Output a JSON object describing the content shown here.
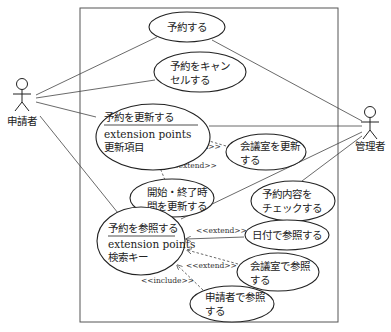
{
  "diagram": {
    "type": "UML use case diagram",
    "colors": {
      "line": "#333333",
      "background": "#ffffff",
      "text": "#222222"
    },
    "actors": [
      {
        "id": "applicant",
        "label": "申請者"
      },
      {
        "id": "admin",
        "label": "管理者"
      }
    ],
    "use_cases": {
      "reserve": {
        "line1": "予約する"
      },
      "cancel": {
        "line1": "予約をキャン",
        "line2": "セルする"
      },
      "update": {
        "title": "予約を更新する",
        "ext_label": "extension points",
        "ext_point": "更新項目"
      },
      "update_room": {
        "line1": "会議室を更新",
        "line2": "する"
      },
      "update_time": {
        "line1": "開始・終了時",
        "line2": "間を更新する"
      },
      "check": {
        "line1": "予約内容を",
        "line2": "チェックする"
      },
      "view": {
        "title": "予約を参照する",
        "ext_label": "extension points",
        "ext_point": "検索キー"
      },
      "view_date": {
        "line1": "日付で参照する"
      },
      "view_room": {
        "line1": "会議室で参照",
        "line2": "する"
      },
      "view_applicant": {
        "line1": "申請者で参照",
        "line2": "する"
      }
    },
    "stereotypes": {
      "extend": "<<extend>>",
      "include": "<<include>>"
    },
    "relations": [
      {
        "from": "申請者",
        "to": "予約する",
        "type": "association"
      },
      {
        "from": "申請者",
        "to": "予約をキャンセルする",
        "type": "association"
      },
      {
        "from": "申請者",
        "to": "予約を更新する",
        "type": "association"
      },
      {
        "from": "申請者",
        "to": "予約を参照する",
        "type": "association"
      },
      {
        "from": "管理者",
        "to": "予約する",
        "type": "association"
      },
      {
        "from": "管理者",
        "to": "予約を更新する",
        "type": "association"
      },
      {
        "from": "管理者",
        "to": "予約を参照する",
        "type": "association"
      },
      {
        "from": "管理者",
        "to": "予約内容をチェックする",
        "type": "association"
      },
      {
        "from": "会議室を更新する",
        "to": "予約を更新する",
        "type": "extend"
      },
      {
        "from": "開始・終了時間を更新する",
        "to": "予約を更新する",
        "type": "extend"
      },
      {
        "from": "日付で参照する",
        "to": "予約を参照する",
        "type": "extend"
      },
      {
        "from": "会議室で参照する",
        "to": "予約を参照する",
        "type": "extend"
      },
      {
        "from": "申請者で参照する",
        "to": "予約を参照する",
        "type": "include"
      }
    ]
  }
}
